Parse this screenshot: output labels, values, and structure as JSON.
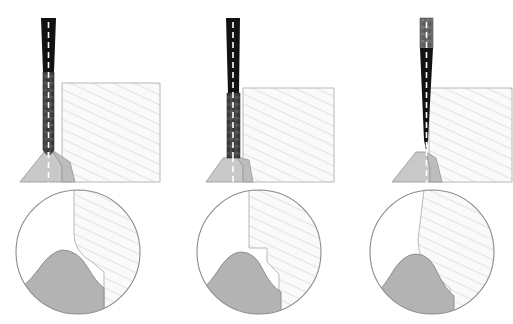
{
  "figure": {
    "type": "technical-illustration",
    "panel_count": 3,
    "background_color": "#ffffff",
    "has_text_labels": false,
    "layout": "three side-by-side panels, each with a side-view schematic above and a circular magnified detail below"
  },
  "palette": {
    "tool_shank_dark": "#121212",
    "tool_flute_gray": "#4a4a4a",
    "tool_collar_gray": "#6e6e6e",
    "centerline_white": "#ffffff",
    "workpiece_fill": "#fafafa",
    "workpiece_hatch": "#e2e2e2",
    "workpiece_outline": "#b4b4b4",
    "burr_light_gray": "#c9c9c9",
    "burr_mid_gray": "#a9a9a9",
    "burr_outline": "#909090",
    "detail_circle_outline": "#8c8c8c",
    "detail_circle_fill": "#ffffff"
  },
  "panels": [
    {
      "id": "panel-1",
      "index": 1,
      "caption": "",
      "tool": {
        "tip_geometry": "rounded-worn-tip",
        "shank_color": "#121212",
        "flute_color": "#4a4a4a",
        "centerline": "white-dashed",
        "tip_x": 50,
        "tip_y": 158,
        "shank_top_y": 18,
        "shank_width": 13,
        "flute_start_y": 72
      },
      "workpiece": {
        "left_x": 62,
        "top_y": 83,
        "right_x": 160,
        "bottom_y": 182,
        "fill": "#fafafa",
        "hatch": "diagonal"
      },
      "burr": {
        "style": "large-triangular-ridge",
        "fill": "#c9c9c9",
        "apex_x": 50,
        "apex_y": 158,
        "base_left_x": 20,
        "base_right_x": 75,
        "base_y": 182
      },
      "detail_circle": {
        "center_x": 78,
        "center_y": 252,
        "radius": 62,
        "edge_profile": "rounded-concave-curve",
        "burr_profile": "smooth-rounded-mound"
      }
    },
    {
      "id": "panel-2",
      "index": 2,
      "caption": "",
      "tool": {
        "tip_geometry": "flat-blunt-tip",
        "shank_color": "#121212",
        "flute_color": "#4a4a4a",
        "centerline": "white-dashed",
        "tip_x": 62,
        "tip_y": 158,
        "shank_top_y": 18,
        "shank_width": 13,
        "flute_start_y": 93
      },
      "workpiece": {
        "left_x": 72,
        "top_y": 88,
        "right_x": 163,
        "bottom_y": 182,
        "fill": "#fafafa",
        "hatch": "diagonal"
      },
      "burr": {
        "style": "trapezoidal-ridge",
        "fill": "#c9c9c9",
        "apex_x": 62,
        "apex_y": 157,
        "base_left_x": 35,
        "base_right_x": 82,
        "base_y": 182
      },
      "detail_circle": {
        "center_x": 88,
        "center_y": 252,
        "radius": 62,
        "edge_profile": "sharp-step-notch",
        "burr_profile": "rounded-mound-with-ledge"
      }
    },
    {
      "id": "panel-3",
      "index": 3,
      "caption": "",
      "tool": {
        "tip_geometry": "sharp-pointed-tip",
        "shank_color": "#121212",
        "flute_color": "#6e6e6e",
        "centerline": "white-dashed",
        "tip_x": 84,
        "tip_y": 150,
        "shank_top_y": 18,
        "shank_width": 12,
        "flute_start_y": 18
      },
      "workpiece": {
        "left_x": 87,
        "top_y": 88,
        "right_x": 170,
        "bottom_y": 182,
        "fill": "#fafafa",
        "hatch": "diagonal"
      },
      "burr": {
        "style": "tall-triangular-ridge",
        "fill": "#c9c9c9",
        "apex_x": 84,
        "apex_y": 152,
        "base_left_x": 50,
        "base_right_x": 100,
        "base_y": 182
      },
      "detail_circle": {
        "center_x": 90,
        "center_y": 252,
        "radius": 62,
        "edge_profile": "slanted-smooth-curve",
        "burr_profile": "broad-rounded-mound"
      }
    }
  ]
}
